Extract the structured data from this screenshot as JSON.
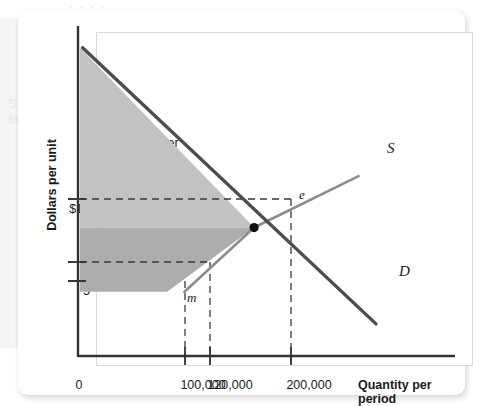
{
  "chart_data": {
    "type": "line",
    "title": "",
    "xlabel": "Quantity per period",
    "ylabel": "Dollars per unit",
    "x_tick_labels": [
      "0",
      "100,000",
      "120,000",
      "200,000"
    ],
    "y_tick_labels": [
      "$10",
      "6",
      "5"
    ],
    "xlim": [
      0,
      340000
    ],
    "ylim": [
      0,
      26
    ],
    "grid": false,
    "legend": "inline-curve-labels",
    "series": [
      {
        "name": "D",
        "label": "D",
        "role": "demand",
        "color": "#4d4d4d",
        "points": [
          [
            3000,
            24.0
          ],
          [
            340000,
            2.5
          ]
        ]
      },
      {
        "name": "S",
        "label": "S",
        "role": "supply",
        "color": "#8c8c8c",
        "points": [
          [
            120000,
            5.0
          ],
          [
            200000,
            10.0
          ],
          [
            320000,
            14.0
          ]
        ]
      }
    ],
    "regions": [
      {
        "name": "consumer-surplus",
        "label": "Consumer surplus",
        "color": "#c2c2c2",
        "vertices": [
          [
            0,
            24.0
          ],
          [
            200000,
            10.0
          ],
          [
            0,
            10.0
          ]
        ]
      },
      {
        "name": "producer-surplus",
        "label": "Producer surplus",
        "color": "#adadad",
        "vertices": [
          [
            0,
            10.0
          ],
          [
            200000,
            10.0
          ],
          [
            120000,
            6.0
          ],
          [
            100000,
            5.0
          ],
          [
            0,
            5.0
          ]
        ]
      }
    ],
    "annotated_points": [
      {
        "name": "e",
        "label": "e",
        "x": 200000,
        "y": 10.0,
        "marker": "filled-dot"
      },
      {
        "name": "m",
        "label": "m",
        "x": 100000,
        "y": 5.0,
        "marker": "none"
      }
    ],
    "guide_lines": [
      {
        "name": "price-10-guide",
        "orientation": "horizontal",
        "value": 10.0,
        "from_x": 0,
        "to_x": 200000,
        "style": "dashed"
      },
      {
        "name": "price-6-guide",
        "orientation": "horizontal",
        "value": 6.0,
        "from_x": 0,
        "to_x": 120000,
        "style": "dashed"
      },
      {
        "name": "qty-100k-guide",
        "orientation": "vertical",
        "value": 100000,
        "style": "dashed"
      },
      {
        "name": "qty-120k-guide",
        "orientation": "vertical",
        "value": 120000,
        "style": "dashed"
      },
      {
        "name": "qty-200k-guide",
        "orientation": "vertical",
        "value": 200000,
        "style": "dashed"
      }
    ]
  },
  "axes": {
    "y_label": "Dollars per unit",
    "x_label": "Quantity per period",
    "y_ticks": {
      "t10": "$10",
      "t6": "6",
      "t5": "5"
    },
    "x_ticks": {
      "zero": "0",
      "t100k": "100,000",
      "t120k": "120,000",
      "t200k": "200,000"
    }
  },
  "regions": {
    "consumer": {
      "line1": "Consumer",
      "line2": "surplus"
    },
    "producer": {
      "line1": "Producer",
      "line2": "surplus"
    }
  },
  "curves": {
    "supply": "S",
    "demand": "D"
  },
  "points": {
    "equilibrium": "e",
    "minimum": "m"
  },
  "colors": {
    "consumer_surplus": "#c2c2c2",
    "producer_surplus": "#adadad",
    "demand_curve": "#4d4d4d",
    "supply_curve": "#8c8c8c",
    "axis": "#333333",
    "text": "#1a1a1a",
    "card": "#ffffff",
    "frame_border": "#d9dadb"
  }
}
